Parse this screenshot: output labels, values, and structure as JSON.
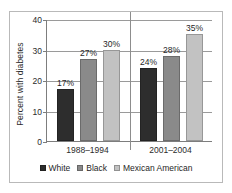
{
  "chart_data": {
    "type": "bar",
    "title": "",
    "subtitle": "",
    "xlabel": "",
    "ylabel": "Percent with diabetes",
    "ylim": [
      0,
      40
    ],
    "yticks": [
      0,
      10,
      20,
      30,
      40
    ],
    "ytick_labels": [
      "0",
      "10",
      "20",
      "30",
      "40"
    ],
    "grid": true,
    "grid_axis": "y",
    "legend_position": "bottom",
    "categories": [
      "1988–1994",
      "2001–2004"
    ],
    "series": [
      {
        "name": "White",
        "color": "#2d2d2d",
        "values": [
          17,
          27
        ],
        "labels": [
          "17%",
          "27%"
        ]
      },
      {
        "name": "Black",
        "color": "#8a8a8a",
        "values": [
          27,
          28
        ],
        "labels": [
          "27%",
          "28%"
        ]
      },
      {
        "name": "Mexican American",
        "color": "#c2c2c2",
        "values": [
          30,
          35
        ],
        "labels": [
          "30%",
          "35%"
        ]
      }
    ],
    "groups": [
      {
        "category": "1988–1994",
        "bars": [
          {
            "series": "White",
            "value": 17,
            "label": "17%",
            "color": "#2d2d2d"
          },
          {
            "series": "Black",
            "value": 27,
            "label": "27%",
            "color": "#8a8a8a"
          },
          {
            "series": "Mexican American",
            "value": 30,
            "label": "30%",
            "color": "#c2c2c2"
          }
        ]
      },
      {
        "category": "2001–2004",
        "bars": [
          {
            "series": "White",
            "value": 24,
            "label": "24%",
            "color": "#2d2d2d"
          },
          {
            "series": "Black",
            "value": 28,
            "label": "28%",
            "color": "#8a8a8a"
          },
          {
            "series": "Mexican American",
            "value": 35,
            "label": "35%",
            "color": "#c2c2c2"
          }
        ]
      }
    ]
  },
  "legend": {
    "items": [
      {
        "label": "White",
        "color": "#2d2d2d"
      },
      {
        "label": "Black",
        "color": "#8a8a8a"
      },
      {
        "label": "Mexican American",
        "color": "#c2c2c2"
      }
    ]
  },
  "colors": {
    "axis": "#7d7d7d",
    "grid": "#9a9a9a",
    "frame": "#b9b9b9",
    "text": "#2b2b2b",
    "background": "#ffffff"
  }
}
